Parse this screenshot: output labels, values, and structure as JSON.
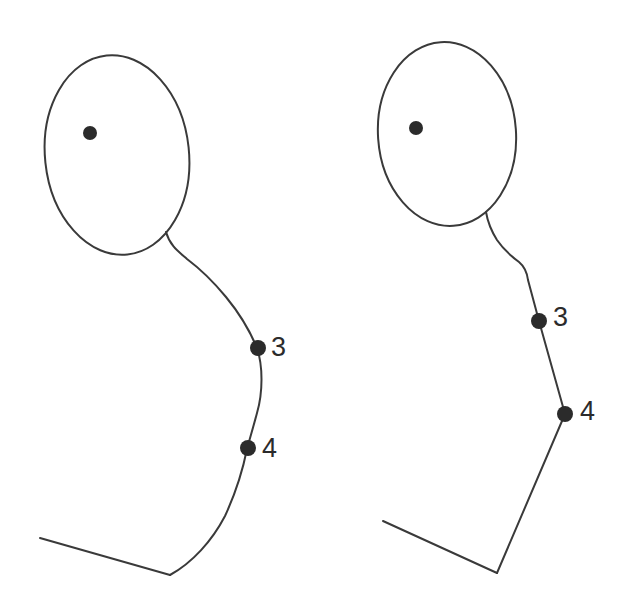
{
  "canvas": {
    "width": 628,
    "height": 615,
    "background_color": "#ffffff",
    "stroke_color": "#3a3a3a",
    "marker_color": "#2b2b2b",
    "label_color": "#2b2b2b",
    "stroke_width": 2
  },
  "figures": [
    {
      "id": "left-figure",
      "name": "smooth-contour-figure",
      "style": "curved",
      "head": {
        "name": "head-outline",
        "shape": "ellipse",
        "cx": 117,
        "cy": 155,
        "rx": 72,
        "ry": 100,
        "rotation": -6
      },
      "eye": {
        "name": "eye-dot",
        "cx": 90,
        "cy": 133,
        "r": 7
      },
      "neck_body_path": "M 166 232 C 170 246 179 252 187 259 C 199 268 212 280 226 297 C 240 314 250 331 257 348 C 263 366 263 392 257 413 C 252 432 249 441 247 449 C 244 464 238 488 225 516 C 212 541 192 563 170 575",
      "shoulder_path": "M 170 575 L 40 538",
      "landmarks": [
        {
          "name": "landmark-3",
          "label": "3",
          "cx": 258,
          "cy": 348,
          "r": 8,
          "label_x": 271,
          "label_y": 349
        },
        {
          "name": "landmark-4",
          "label": "4",
          "cx": 248,
          "cy": 448,
          "r": 8,
          "label_x": 262,
          "label_y": 450
        }
      ]
    },
    {
      "id": "right-figure",
      "name": "polygonal-contour-figure",
      "style": "straight",
      "head": {
        "name": "head-outline",
        "shape": "ellipse",
        "cx": 447,
        "cy": 134,
        "rx": 69,
        "ry": 92,
        "rotation": -4
      },
      "eye": {
        "name": "eye-dot",
        "cx": 416,
        "cy": 128,
        "r": 7
      },
      "neck_body_path": "M 486 212 C 488 224 492 232 497 240 C 503 249 511 256 519 262 C 525 267 527 272 528 280 L 539 321 L 565 414",
      "lower_body_path": "M 565 414 L 497 573",
      "shoulder_path": "M 497 573 L 383 521",
      "landmarks": [
        {
          "name": "landmark-3",
          "label": "3",
          "cx": 539,
          "cy": 321,
          "r": 8,
          "label_x": 553,
          "label_y": 319
        },
        {
          "name": "landmark-4",
          "label": "4",
          "cx": 565,
          "cy": 414,
          "r": 8,
          "label_x": 580,
          "label_y": 413
        }
      ]
    }
  ]
}
